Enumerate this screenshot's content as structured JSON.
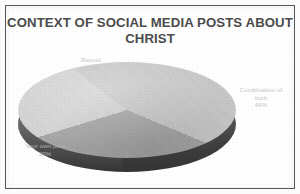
{
  "chart_data": {
    "type": "pie",
    "title": "CONTEXT OF SOCIAL MEDIA POSTS ABOUT CHRIST",
    "title_line1": "CONTEXT OF SOCIAL MEDIA POSTS ABOUT",
    "title_line2": "CHRIST",
    "style": "3d-pie",
    "grid": false,
    "legend": "none",
    "labels_position": "outside",
    "categories": [
      "Combination of both",
      "Your own post",
      "Repost"
    ],
    "values": [
      46,
      39,
      15
    ],
    "value_unit": "%",
    "slices": [
      {
        "name": "Combination of both",
        "label_line1": "Combination of",
        "label_line2": "both",
        "value": 46,
        "value_text": "46%",
        "color": "#c9c9c9",
        "position": "right"
      },
      {
        "name": "Your own post",
        "label_line1": "Your own post",
        "label_line2": "",
        "value": 39,
        "value_text": "39%",
        "color": "#a6a6a6",
        "position": "left"
      },
      {
        "name": "Repost",
        "label_line1": "Repost",
        "label_line2": "",
        "value": 15,
        "value_text": "15%",
        "color": "#d5d5d5",
        "position": "top"
      }
    ],
    "xlabel": "",
    "ylabel": ""
  },
  "colors": {
    "page_background": "#fdfdfd",
    "plot_background": "#ffffff",
    "frame_border": "#575757",
    "title_text": "#4c4c4c",
    "label_text": "#c3c3c3",
    "slice_combination": "#c9c9c9",
    "slice_own_post": "#a6a6a6",
    "slice_repost": "#d5d5d5",
    "pie_side_wall": "#3f3f3f"
  }
}
